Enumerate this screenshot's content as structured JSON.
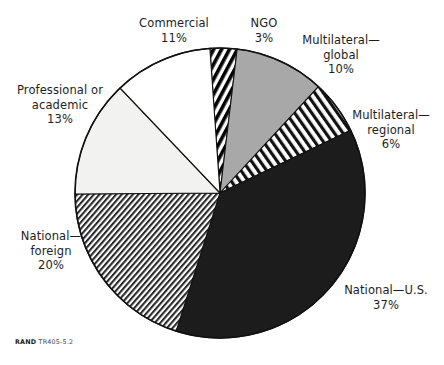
{
  "figure": {
    "credit_brand": "RAND",
    "credit_id": "TR405-5.2"
  },
  "chart_data": {
    "type": "pie",
    "title": "",
    "total_percent": 100,
    "units": "percent",
    "legend_position": "callout-labels",
    "center": {
      "x": 220,
      "y": 193
    },
    "radius": 145,
    "start_angle_deg": -4,
    "categories": [
      "NGO",
      "Multilateral—global",
      "Multilateral—regional",
      "National—U.S.",
      "National—foreign",
      "Professional or academic",
      "Commercial"
    ],
    "values": [
      3,
      10,
      6,
      37,
      20,
      13,
      11
    ],
    "slices": [
      {
        "name": "NGO",
        "label_line1": "NGO",
        "label_line2": "",
        "value": 3,
        "value_label": "3%",
        "fill": "dense-diagonal-hatch-black",
        "fill_color": "#000000",
        "background": "#ffffff"
      },
      {
        "name": "Multilateral—global",
        "label_line1": "Multilateral—",
        "label_line2": "global",
        "value": 10,
        "value_label": "10%",
        "fill": "solid",
        "fill_color": "#a8a8a8",
        "background": "#a8a8a8"
      },
      {
        "name": "Multilateral—regional",
        "label_line1": "Multilateral—",
        "label_line2": "regional",
        "value": 6,
        "value_label": "6%",
        "fill": "diagonal-hatch-up",
        "fill_color": "#111111",
        "background": "#ffffff"
      },
      {
        "name": "National—U.S.",
        "label_line1": "National—U.S.",
        "label_line2": "",
        "value": 37,
        "value_label": "37%",
        "fill": "solid",
        "fill_color": "#1c1c1c",
        "background": "#1c1c1c"
      },
      {
        "name": "National—foreign",
        "label_line1": "National—",
        "label_line2": "foreign",
        "value": 20,
        "value_label": "20%",
        "fill": "fine-diagonal-hatch-down",
        "fill_color": "#2a2a2a",
        "background": "#ffffff"
      },
      {
        "name": "Professional or academic",
        "label_line1": "Professional or",
        "label_line2": "academic",
        "value": 13,
        "value_label": "13%",
        "fill": "solid",
        "fill_color": "#f2f2f0",
        "background": "#f2f2f0"
      },
      {
        "name": "Commercial",
        "label_line1": "Commercial",
        "label_line2": "",
        "value": 11,
        "value_label": "11%",
        "fill": "solid",
        "fill_color": "#ffffff",
        "background": "#ffffff"
      }
    ],
    "colors": {
      "outline": "#111111",
      "text": "#1d1d1d",
      "page_background": "#ffffff"
    }
  },
  "labels": {
    "commercial": "Commercial\n11%",
    "ngo": "NGO\n3%",
    "multilateral_global": "Multilateral—\nglobal\n10%",
    "multilateral_regional": "Multilateral—\nregional\n6%",
    "national_us": "National—U.S.\n37%",
    "national_foreign": "National—\nforeign\n20%",
    "professional_academic": "Professional or\nacademic\n13%"
  }
}
